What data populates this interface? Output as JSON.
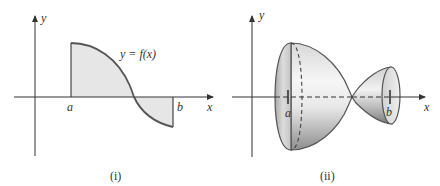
{
  "figures": [
    {
      "id": "i",
      "caption": "(i)",
      "axis_labels": {
        "x": "x",
        "y": "y"
      },
      "bound_labels": {
        "a": "a",
        "b": "b"
      },
      "curve_label": "y = f(x)",
      "description": "Region between curve y=f(x) and x-axis from a to b, shaded; curve positive near a, crosses axis, negative near b"
    },
    {
      "id": "ii",
      "caption": "(ii)",
      "axis_labels": {
        "x": "x",
        "y": "y"
      },
      "bound_labels": {
        "a": "a",
        "b": "b"
      },
      "description": "Solid of revolution obtained by rotating region (i) about the x-axis; large bowl at a pinching to a point, then a smaller cone-like cup ending at b"
    }
  ],
  "colors": {
    "line": "#3a3a3a",
    "curve": "#555555",
    "fill": "#e6e6e6",
    "solid_light": "#f4f4f4",
    "solid_dark": "#8a8a8a"
  }
}
